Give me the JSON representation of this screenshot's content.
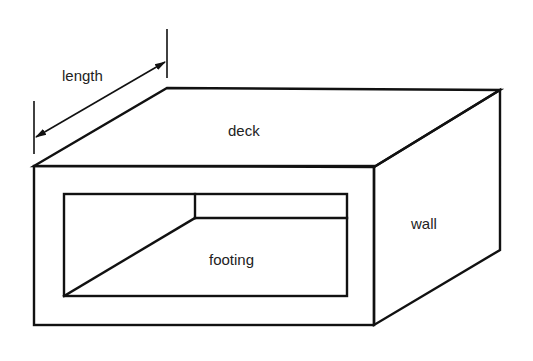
{
  "diagram": {
    "type": "isometric box culvert schematic",
    "labels": {
      "length": "length",
      "deck": "deck",
      "wall": "wall",
      "footing": "footing"
    },
    "colors": {
      "line": "#111111",
      "text": "#222222",
      "background": "#ffffff"
    }
  }
}
